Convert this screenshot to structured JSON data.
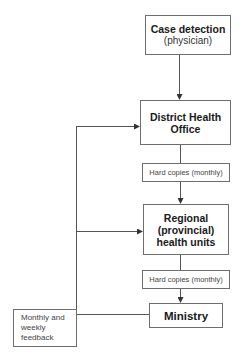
{
  "diagram": {
    "nodes": {
      "case_detection": {
        "title": "Case detection",
        "subtitle": "(physician)"
      },
      "district": {
        "title_line1": "District Health",
        "title_line2": "Office"
      },
      "hard_copies_1": {
        "label": "Hard copies (monthly)"
      },
      "regional": {
        "line1": "Regional",
        "line2": "(provincial)",
        "line3": "health units"
      },
      "hard_copies_2": {
        "label": "Hard copies (monthly)"
      },
      "ministry": {
        "title": "Ministry"
      },
      "feedback": {
        "line1": "Monthly and",
        "line2": "weekly",
        "line3": "feedback"
      }
    },
    "edges": [
      {
        "from": "Case detection",
        "to": "District Health Office"
      },
      {
        "from": "District Health Office",
        "to": "Regional (provincial) health units",
        "via": "Hard copies (monthly)"
      },
      {
        "from": "Regional (provincial) health units",
        "to": "Ministry",
        "via": "Hard copies (monthly)"
      },
      {
        "from": "Ministry",
        "to": "District Health Office",
        "via": "Monthly and weekly feedback"
      },
      {
        "from": "Ministry",
        "to": "Regional (provincial) health units",
        "via": "Monthly and weekly feedback"
      }
    ],
    "colors": {
      "line": "#555555",
      "border": "#6e6e6e",
      "text": "#1a1a1a"
    }
  }
}
